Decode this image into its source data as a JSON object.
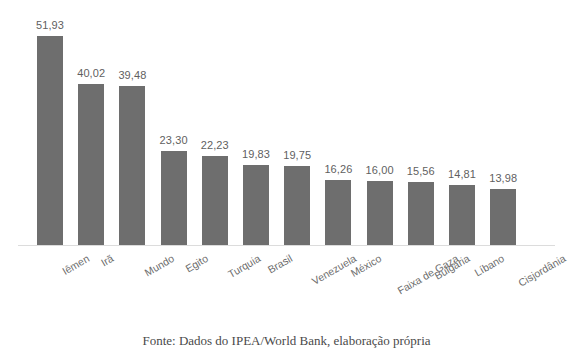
{
  "chart_data": {
    "type": "bar",
    "title": "",
    "subtitle": "",
    "xlabel": "",
    "ylabel": "",
    "ylim": [
      0,
      51.93
    ],
    "grid": false,
    "legend": "none",
    "orientation": "vertical",
    "bar_color": "#6e6e6e",
    "background_color": "#ffffff",
    "axis_line_color": "#dcdcdc",
    "label_color": "#6b6b6b",
    "value_color": "#5f5f5f",
    "decimal_separator": ",",
    "tick_label_rotation": -30,
    "categories": [
      "Iêmen",
      "Irã",
      "Mundo",
      "Egito",
      "Turquia",
      "Brasil",
      "Venezuela",
      "México",
      "Faixa de Gaza",
      "Bulgária",
      "Líbano",
      "Cisjordânia"
    ],
    "values": [
      51.93,
      40.02,
      39.48,
      23.3,
      22.23,
      19.83,
      19.75,
      16.26,
      16.0,
      15.56,
      14.81,
      13.98
    ],
    "value_labels": [
      "51,93",
      "40,02",
      "39,48",
      "23,30",
      "22,23",
      "19,83",
      "19,75",
      "16,26",
      "16,00",
      "15,56",
      "14,81",
      "13,98"
    ]
  },
  "bars": [
    {
      "category": "Iêmen",
      "value": 51.93,
      "label": "51,93"
    },
    {
      "category": "Irã",
      "value": 40.02,
      "label": "40,02"
    },
    {
      "category": "Mundo",
      "value": 39.48,
      "label": "39,48"
    },
    {
      "category": "Egito",
      "value": 23.3,
      "label": "23,30"
    },
    {
      "category": "Turquia",
      "value": 22.23,
      "label": "22,23"
    },
    {
      "category": "Brasil",
      "value": 19.83,
      "label": "19,83"
    },
    {
      "category": "Venezuela",
      "value": 19.75,
      "label": "19,75"
    },
    {
      "category": "México",
      "value": 16.26,
      "label": "16,26"
    },
    {
      "category": "Faixa de Gaza",
      "value": 16.0,
      "label": "16,00"
    },
    {
      "category": "Bulgária",
      "value": 15.56,
      "label": "15,56"
    },
    {
      "category": "Líbano",
      "value": 14.81,
      "label": "14,81"
    },
    {
      "category": "Cisjordânia",
      "value": 13.98,
      "label": "13,98"
    }
  ],
  "caption": {
    "text": "Fonte: Dados do IPEA/World Bank, elaboração própria",
    "clipped": true
  }
}
